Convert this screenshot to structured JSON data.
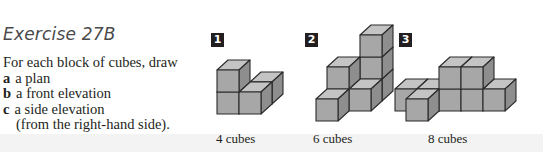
{
  "exercise": {
    "title": "Exercise 27B",
    "intro": "For each block of cubes, draw",
    "items": [
      {
        "label": "a",
        "text": "a plan"
      },
      {
        "label": "b",
        "text": "a front elevation"
      },
      {
        "label": "c",
        "text": "a side elevation"
      }
    ],
    "continuation": "(from the right-hand side)."
  },
  "figures": [
    {
      "number": "1",
      "caption": "4 cubes",
      "cube_count": 4
    },
    {
      "number": "2",
      "caption": "6 cubes",
      "cube_count": 6
    },
    {
      "number": "3",
      "caption": "8 cubes",
      "cube_count": 8
    }
  ],
  "colors": {
    "front_face": "#a7a7a7",
    "top_face": "#c4c4c4",
    "side_face": "#8e8e8e",
    "edge": "#2b2b2b",
    "badge": "#231f20"
  }
}
